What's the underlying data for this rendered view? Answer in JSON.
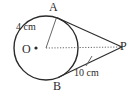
{
  "figure": {
    "type": "circle-with-two-tangents",
    "canvas": {
      "width": 138,
      "height": 97,
      "background": "#ffffff"
    },
    "stroke_color": "#2b2b2b",
    "dotted_color": "#555555",
    "circle": {
      "center_label": "O",
      "center_x": 46,
      "center_y": 48,
      "radius_px": 32
    },
    "points": [
      {
        "name": "A",
        "label": "A",
        "x": 57,
        "y": 18,
        "role": "tangent-point-upper"
      },
      {
        "name": "B",
        "label": "B",
        "x": 59,
        "y": 78,
        "role": "tangent-point-lower"
      },
      {
        "name": "O",
        "label": "O",
        "x": 46,
        "y": 48,
        "role": "circle-center"
      },
      {
        "name": "P",
        "label": "P",
        "x": 123,
        "y": 47,
        "role": "external-point"
      }
    ],
    "measurements": [
      {
        "name": "radius",
        "label": "4 cm",
        "value": 4,
        "unit": "cm",
        "from": "O",
        "to": "A"
      },
      {
        "name": "tangent-length",
        "label": "10 cm",
        "value": 10,
        "unit": "cm",
        "from": "B",
        "to": "P"
      }
    ],
    "segments": [
      {
        "name": "radius-OA",
        "from": "O",
        "to": "A",
        "style": "solid-thin"
      },
      {
        "name": "tangent-AP",
        "from": "A",
        "to": "P",
        "style": "solid"
      },
      {
        "name": "tangent-BP",
        "from": "B",
        "to": "P",
        "style": "solid"
      },
      {
        "name": "line-OP",
        "from": "O",
        "to": "P",
        "style": "dotted"
      }
    ]
  }
}
